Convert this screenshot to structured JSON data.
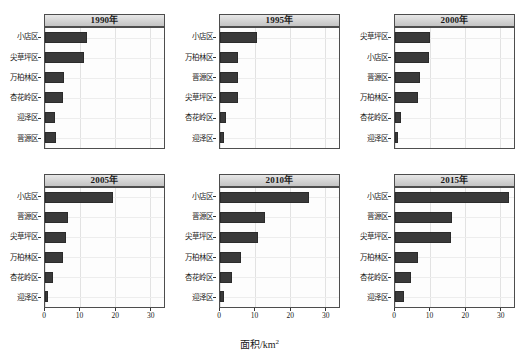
{
  "figure": {
    "xlabel_text": "面积/km",
    "xlabel_exponent": "2",
    "xlabel_full": "面积/km²"
  },
  "axis": {
    "ticks": [
      {
        "value": 0,
        "label": "0"
      },
      {
        "value": 10,
        "label": "10"
      },
      {
        "value": 20,
        "label": "20"
      },
      {
        "value": 30,
        "label": "30"
      }
    ],
    "xmin": 0,
    "xmax": 34
  },
  "panels": [
    {
      "title": "1990年",
      "categories": [
        "小店区",
        "尖草坪区",
        "万柏林区",
        "杏花岭区",
        "迎泽区",
        "晋源区"
      ],
      "values": [
        11.9,
        11.1,
        5.3,
        5.1,
        2.8,
        3.1
      ]
    },
    {
      "title": "1995年",
      "categories": [
        "小店区",
        "万柏林区",
        "晋源区",
        "尖草坪区",
        "杏花岭区",
        "迎泽区"
      ],
      "values": [
        10.5,
        5.0,
        5.0,
        5.2,
        1.6,
        1.0
      ]
    },
    {
      "title": "2000年",
      "categories": [
        "尖草坪区",
        "小店区",
        "晋源区",
        "万柏林区",
        "杏花岭区",
        "迎泽区"
      ],
      "values": [
        9.9,
        9.6,
        7.0,
        6.6,
        1.6,
        0.9
      ]
    },
    {
      "title": "2005年",
      "categories": [
        "小店区",
        "晋源区",
        "尖草坪区",
        "万柏林区",
        "杏花岭区",
        "迎泽区"
      ],
      "values": [
        19.3,
        6.7,
        6.1,
        5.2,
        2.3,
        0.9
      ]
    },
    {
      "title": "2010年",
      "categories": [
        "小店区",
        "晋源区",
        "尖草坪区",
        "万柏林区",
        "杏花岭区",
        "迎泽区"
      ],
      "values": [
        25.3,
        12.9,
        10.9,
        6.0,
        3.4,
        1.2
      ]
    },
    {
      "title": "2015年",
      "categories": [
        "小店区",
        "晋源区",
        "尖草坪区",
        "万柏林区",
        "杏花岭区",
        "迎泽区"
      ],
      "values": [
        32.7,
        16.2,
        16.0,
        6.7,
        4.7,
        2.6
      ]
    }
  ],
  "chart_data": {
    "type": "bar",
    "orientation": "horizontal",
    "title": "",
    "xlabel": "面积/km²",
    "ylabel": "",
    "xlim": [
      0,
      34
    ],
    "grid": true,
    "legend": "none",
    "layout": "2 rows x 3 columns trellis, one panel per year",
    "panel_titles": [
      "1990年",
      "1995年",
      "2000年",
      "2005年",
      "2010年",
      "2015年"
    ],
    "xticks": [
      0,
      10,
      20,
      30
    ],
    "bar_color": "#3a3a3a",
    "note": "Each panel's categories are sorted in descending bar length; values estimated from axis (km²).",
    "panels": [
      {
        "title": "1990年",
        "categories": [
          "小店区",
          "尖草坪区",
          "万柏林区",
          "杏花岭区",
          "迎泽区",
          "晋源区"
        ],
        "values": [
          11.9,
          11.1,
          5.3,
          5.1,
          2.8,
          3.1
        ]
      },
      {
        "title": "1995年",
        "categories": [
          "小店区",
          "万柏林区",
          "晋源区",
          "尖草坪区",
          "杏花岭区",
          "迎泽区"
        ],
        "values": [
          10.5,
          5.0,
          5.0,
          5.2,
          1.6,
          1.0
        ]
      },
      {
        "title": "2000年",
        "categories": [
          "尖草坪区",
          "小店区",
          "晋源区",
          "万柏林区",
          "杏花岭区",
          "迎泽区"
        ],
        "values": [
          9.9,
          9.6,
          7.0,
          6.6,
          1.6,
          0.9
        ]
      },
      {
        "title": "2005年",
        "categories": [
          "小店区",
          "晋源区",
          "尖草坪区",
          "万柏林区",
          "杏花岭区",
          "迎泽区"
        ],
        "values": [
          19.3,
          6.7,
          6.1,
          5.2,
          2.3,
          0.9
        ]
      },
      {
        "title": "2010年",
        "categories": [
          "小店区",
          "晋源区",
          "尖草坪区",
          "万柏林区",
          "杏花岭区",
          "迎泽区"
        ],
        "values": [
          25.3,
          12.9,
          10.9,
          6.0,
          3.4,
          1.2
        ]
      },
      {
        "title": "2015年",
        "categories": [
          "小店区",
          "晋源区",
          "尖草坪区",
          "万柏林区",
          "杏花岭区",
          "迎泽区"
        ],
        "values": [
          32.7,
          16.2,
          16.0,
          6.7,
          4.7,
          2.6
        ]
      }
    ]
  }
}
